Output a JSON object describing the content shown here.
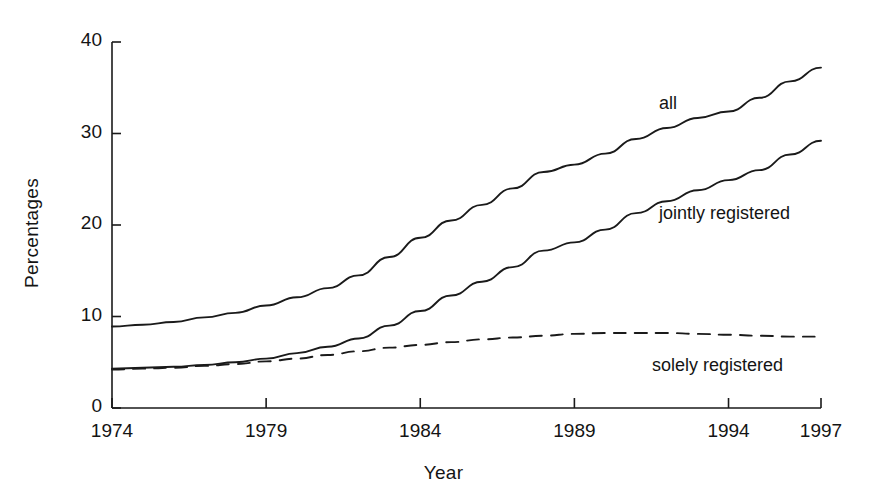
{
  "chart_data": {
    "type": "line",
    "title": "",
    "xlabel": "Year",
    "ylabel": "Percentages",
    "xlim": [
      1974,
      1997
    ],
    "ylim": [
      0,
      40
    ],
    "ytick_labels": [
      "0",
      "10",
      "20",
      "30",
      "40"
    ],
    "ytick_values": [
      0,
      10,
      20,
      30,
      40
    ],
    "xtick_labels": [
      "1974",
      "1979",
      "1984",
      "1989",
      "1994",
      "1997"
    ],
    "xtick_values": [
      1974,
      1979,
      1984,
      1989,
      1994,
      1997
    ],
    "grid": false,
    "legend_position": "inline-annotations",
    "x": [
      1974,
      1975,
      1976,
      1977,
      1978,
      1979,
      1980,
      1981,
      1982,
      1983,
      1984,
      1985,
      1986,
      1987,
      1988,
      1989,
      1990,
      1991,
      1992,
      1993,
      1994,
      1995,
      1996,
      1997
    ],
    "series": [
      {
        "name": "all",
        "style": "solid",
        "color": "#1a1a1a",
        "label_text": "all",
        "values": [
          8.9,
          9.1,
          9.4,
          9.9,
          10.4,
          11.2,
          12.1,
          13.1,
          14.5,
          16.5,
          18.6,
          20.5,
          22.2,
          24.0,
          25.8,
          26.6,
          27.8,
          29.4,
          30.6,
          31.7,
          32.4,
          33.9,
          35.7,
          37.2
        ]
      },
      {
        "name": "jointly registered",
        "style": "solid",
        "color": "#1a1a1a",
        "label_text": "jointly registered",
        "values": [
          4.3,
          4.4,
          4.5,
          4.7,
          5.0,
          5.4,
          6.0,
          6.7,
          7.6,
          9.0,
          10.6,
          12.3,
          13.8,
          15.4,
          17.2,
          18.1,
          19.5,
          21.3,
          22.6,
          23.8,
          24.9,
          26.0,
          27.7,
          29.2
        ]
      },
      {
        "name": "solely registered",
        "style": "dashed",
        "color": "#1a1a1a",
        "label_text": "solely registered",
        "values": [
          4.2,
          4.3,
          4.4,
          4.6,
          4.8,
          5.1,
          5.4,
          5.8,
          6.2,
          6.6,
          6.9,
          7.2,
          7.5,
          7.7,
          7.9,
          8.1,
          8.2,
          8.2,
          8.2,
          8.1,
          8.0,
          7.9,
          7.8,
          7.8
        ]
      }
    ]
  },
  "annotations": {
    "all": "all",
    "jointly": "jointly registered",
    "solely": "solely registered"
  }
}
